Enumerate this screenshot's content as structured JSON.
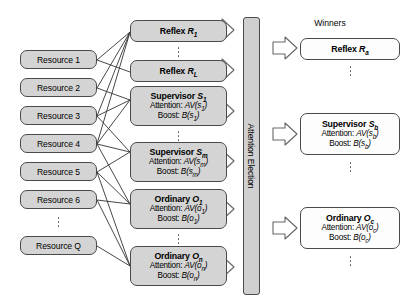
{
  "diagram": {
    "title_present": false,
    "colors": {
      "node_fill": "#d4d4d4",
      "node_fill_white": "#fdfdfd",
      "node_stroke": "#4a4a4a",
      "bar_fill": "#d0d0d0",
      "arrow_fill": "#ffffff",
      "arrow_stroke": "#555555",
      "line_stroke": "#333333",
      "text": "#000000",
      "background": "#ffffff"
    },
    "resources": {
      "label": "resource-column",
      "items": [
        {
          "label": "Resource 1"
        },
        {
          "label": "Resource 2"
        },
        {
          "label": "Resource 3"
        },
        {
          "label": "Resource 4"
        },
        {
          "label": "Resource 5"
        },
        {
          "label": "Resource 6"
        },
        {
          "label": "Resource Q"
        }
      ],
      "ellipsis_after_index": 5
    },
    "behaviors": {
      "label": "behavior-column",
      "items": [
        {
          "kind": "reflex",
          "title_prefix": "Reflex ",
          "title_symbol": "R",
          "title_sub": "1",
          "lines": []
        },
        {
          "kind": "reflex",
          "title_prefix": "Reflex ",
          "title_symbol": "R",
          "title_sub": "L",
          "lines": []
        },
        {
          "kind": "supervisor",
          "title_prefix": "Supervisor ",
          "title_symbol": "S",
          "title_sub": "1",
          "lines": [
            {
              "label": "Attention: ",
              "fn": "AV",
              "arg": "s",
              "arg_sub": "1"
            },
            {
              "label": "Boost: ",
              "fn": "B",
              "arg": "s",
              "arg_sub": "1"
            }
          ]
        },
        {
          "kind": "supervisor",
          "title_prefix": "Supervisor ",
          "title_symbol": "S",
          "title_sub": "m",
          "lines": [
            {
              "label": "Attention: ",
              "fn": "AV",
              "arg": "s",
              "arg_sub": "m"
            },
            {
              "label": "Boost: ",
              "fn": "B",
              "arg": "s",
              "arg_sub": "m"
            }
          ]
        },
        {
          "kind": "ordinary",
          "title_prefix": "Ordinary ",
          "title_symbol": "O",
          "title_sub": "1",
          "lines": [
            {
              "label": "Attention: ",
              "fn": "AV",
              "arg": "o",
              "arg_sub": "1"
            },
            {
              "label": "Boost: ",
              "fn": "B",
              "arg": "o",
              "arg_sub": "1"
            }
          ]
        },
        {
          "kind": "ordinary",
          "title_prefix": "Ordinary ",
          "title_symbol": "O",
          "title_sub": "n",
          "lines": [
            {
              "label": "Attention: ",
              "fn": "AV",
              "arg": "o",
              "arg_sub": "n"
            },
            {
              "label": "Boost: ",
              "fn": "B",
              "arg": "o",
              "arg_sub": "n"
            }
          ]
        }
      ],
      "ellipsis_after_indices": [
        0,
        2,
        4
      ]
    },
    "election_bar": {
      "label": "Attention Election",
      "orientation": "vertical"
    },
    "winners": {
      "header": "Winners",
      "items": [
        {
          "kind": "reflex",
          "title_prefix": "Reflex ",
          "title_symbol": "R",
          "title_sub": "a",
          "lines": []
        },
        {
          "kind": "supervisor",
          "title_prefix": "Supervisor ",
          "title_symbol": "S",
          "title_sub": "b",
          "lines": [
            {
              "label": "Attention: ",
              "fn": "AV",
              "arg": "s",
              "arg_sub": "b"
            },
            {
              "label": "Boost: ",
              "fn": "B",
              "arg": "s",
              "arg_sub": "b"
            }
          ]
        },
        {
          "kind": "ordinary",
          "title_prefix": "Ordinary ",
          "title_symbol": "O",
          "title_sub": "c",
          "lines": [
            {
              "label": "Attention: ",
              "fn": "AV",
              "arg": "o",
              "arg_sub": "c"
            },
            {
              "label": "Boost: ",
              "fn": "B",
              "arg": "o",
              "arg_sub": "c"
            }
          ]
        }
      ],
      "ellipsis_after_indices": [
        0,
        1,
        2
      ]
    },
    "arrows": {
      "into_election_count": 6,
      "out_of_election_count": 3,
      "glyph": "block-arrow-right"
    }
  }
}
